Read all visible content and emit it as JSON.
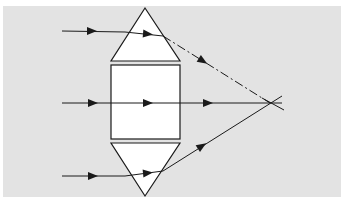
{
  "diagram": {
    "colors": {
      "page": "#ffffff",
      "panel": "#e3e3e3",
      "element_fill": "#ffffff",
      "stroke": "#1a1a1a"
    },
    "panel": {
      "x": 3,
      "y": 6,
      "w": 338,
      "h": 191
    },
    "elements": [
      {
        "id": "top-prism",
        "type": "triangle",
        "points": [
          [
            145,
            8
          ],
          [
            111,
            61
          ],
          [
            180,
            61
          ]
        ]
      },
      {
        "id": "center-block",
        "type": "rect",
        "x": 111,
        "y": 65,
        "w": 69,
        "h": 74
      },
      {
        "id": "bottom-prism",
        "type": "triangle",
        "points": [
          [
            111,
            143
          ],
          [
            180,
            143
          ],
          [
            145,
            196
          ]
        ]
      }
    ],
    "focal_point": {
      "x": 270,
      "y": 103
    },
    "rays": [
      {
        "id": "top-ray",
        "segments": [
          {
            "from": [
              62,
              31
            ],
            "to": [
              125,
              32
            ],
            "style": "solid"
          },
          {
            "from": [
              125,
              32
            ],
            "to": [
              163,
              36
            ],
            "style": "solid"
          },
          {
            "from": [
              163,
              36
            ],
            "to": [
              270,
              103
            ],
            "style": "dashed"
          }
        ],
        "arrows": [
          {
            "x": 92,
            "y": 31,
            "angle": 0
          },
          {
            "x": 148,
            "y": 34,
            "angle": 5
          },
          {
            "x": 203,
            "y": 61,
            "angle": 32
          }
        ]
      },
      {
        "id": "middle-ray",
        "segments": [
          {
            "from": [
              62,
              103
            ],
            "to": [
              282,
              103
            ],
            "style": "solid"
          }
        ],
        "arrows": [
          {
            "x": 93,
            "y": 103,
            "angle": 0
          },
          {
            "x": 148,
            "y": 103,
            "angle": 0
          },
          {
            "x": 208,
            "y": 103,
            "angle": 0
          }
        ]
      },
      {
        "id": "bottom-ray",
        "segments": [
          {
            "from": [
              62,
              176
            ],
            "to": [
              125,
              176
            ],
            "style": "solid"
          },
          {
            "from": [
              125,
              176
            ],
            "to": [
              163,
              171
            ],
            "style": "solid"
          },
          {
            "from": [
              163,
              171
            ],
            "to": [
              282,
              96
            ],
            "style": "solid"
          }
        ],
        "arrows": [
          {
            "x": 93,
            "y": 176,
            "angle": 0
          },
          {
            "x": 148,
            "y": 173,
            "angle": -6
          },
          {
            "x": 202,
            "y": 146,
            "angle": -33
          }
        ]
      }
    ],
    "crossing_extension": {
      "from": [
        262,
        98
      ],
      "to": [
        284,
        110
      ]
    }
  }
}
